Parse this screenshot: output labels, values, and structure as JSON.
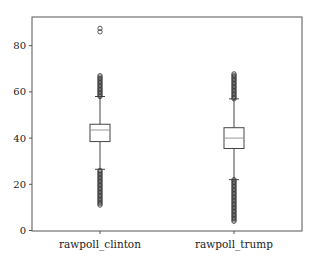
{
  "chart_data": {
    "type": "box",
    "title": "",
    "xlabel": "",
    "ylabel": "",
    "ylim": [
      0,
      93
    ],
    "yticks": [
      0,
      20,
      40,
      60,
      80
    ],
    "grid": false,
    "legend": null,
    "categories": [
      "rawpoll_clinton",
      "rawpoll_trump"
    ],
    "series": [
      {
        "name": "rawpoll_clinton",
        "whisker_low": 26.5,
        "q1": 38.5,
        "median": 43.5,
        "q3": 46,
        "whisker_high": 58,
        "outliers_high_range": [
          58,
          67
        ],
        "outliers_high_extra": [
          86,
          87.5
        ],
        "outliers_low_range": [
          11,
          26.5
        ]
      },
      {
        "name": "rawpoll_trump",
        "whisker_low": 22,
        "q1": 35.5,
        "median": 40,
        "q3": 44.5,
        "whisker_high": 57,
        "outliers_high_range": [
          57,
          68
        ],
        "outliers_high_extra": [],
        "outliers_low_range": [
          4,
          22
        ]
      }
    ]
  },
  "axes": {
    "y_tick_labels": [
      "0",
      "20",
      "40",
      "60",
      "80"
    ],
    "x_tick_labels": [
      "rawpoll_clinton",
      "rawpoll_trump"
    ]
  },
  "colors": {
    "frame": "#555555",
    "box": "#444444",
    "median": "#999999",
    "outlier": "#333333"
  }
}
